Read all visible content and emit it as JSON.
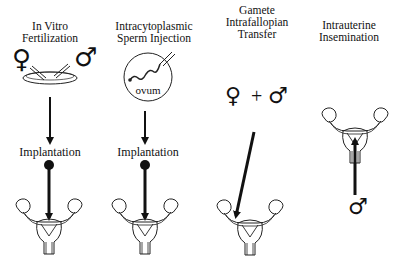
{
  "columns": [
    {
      "id": "ivf",
      "title_lines": [
        "In Vitro",
        "Fertilization"
      ],
      "step_label": "Implantation",
      "dish_label": ""
    },
    {
      "id": "icsi",
      "title_lines": [
        "Intracytoplasmic",
        "Sperm Injection"
      ],
      "step_label": "Implantation",
      "dish_label": "ovum"
    },
    {
      "id": "gift",
      "title_lines": [
        "Gamete",
        "Intrafallopian",
        "Transfer"
      ],
      "plus": "+"
    },
    {
      "id": "iui",
      "title_lines": [
        "Intrauterine",
        "Insemination"
      ]
    }
  ],
  "symbols": {
    "female": "♀",
    "male": "♂"
  }
}
